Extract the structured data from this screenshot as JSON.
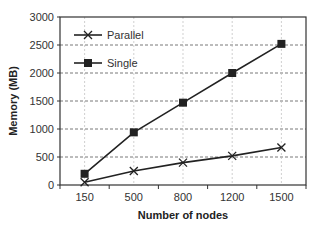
{
  "chart_data": {
    "type": "line",
    "title": "",
    "xlabel": "Number of nodes",
    "ylabel": "Memory (MB)",
    "categories": [
      "150",
      "500",
      "800",
      "1200",
      "1500"
    ],
    "series": [
      {
        "name": "Parallel",
        "marker": "x",
        "color": "#222222",
        "values": [
          50,
          250,
          400,
          520,
          670
        ]
      },
      {
        "name": "Single",
        "marker": "square",
        "color": "#222222",
        "values": [
          200,
          940,
          1470,
          2000,
          2520
        ]
      }
    ],
    "ylim": [
      0,
      3000
    ],
    "yticks": [
      0,
      500,
      1000,
      1500,
      2000,
      2500,
      3000
    ],
    "grid": true,
    "legend_position": "upper-left inside"
  }
}
